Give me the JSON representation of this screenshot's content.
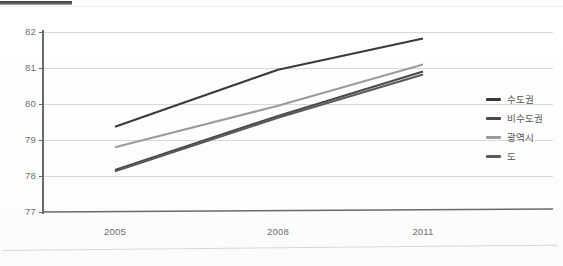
{
  "page": {
    "background_color": "#ffffff",
    "top_rule_color": "#3d3d3d",
    "bottom_rule_color": "#d8d8d8"
  },
  "axis": {
    "y_ticks": [
      "82",
      "81",
      "80",
      "79",
      "78",
      "77"
    ],
    "x_ticks": [
      "2005",
      "2008",
      "2011"
    ],
    "axis_line_color": "#6a6a6a",
    "gridline_color": "#d9d9d9"
  },
  "legend": {
    "position": "right",
    "items": [
      {
        "label": "수도권",
        "color": "#3a3a3a"
      },
      {
        "label": "비수도권",
        "color": "#4a4a4a"
      },
      {
        "label": "광역시",
        "color": "#9b9b9b"
      },
      {
        "label": "도",
        "color": "#5a5a5a"
      }
    ]
  },
  "chart_data": {
    "type": "line",
    "title": "",
    "xlabel": "",
    "ylabel": "",
    "x": [
      "2005",
      "2008",
      "2011"
    ],
    "categories": [
      "2005",
      "2008",
      "2011"
    ],
    "ylim": [
      77,
      82
    ],
    "y_ticks": [
      77,
      78,
      79,
      80,
      81,
      82
    ],
    "grid": true,
    "legend_position": "right",
    "series": [
      {
        "name": "수도권",
        "color": "#3a3a3a",
        "values": [
          79.37,
          80.95,
          81.82
        ]
      },
      {
        "name": "비수도권",
        "color": "#4a4a4a",
        "values": [
          78.17,
          79.67,
          80.9
        ]
      },
      {
        "name": "광역시",
        "color": "#9b9b9b",
        "values": [
          78.8,
          79.95,
          81.1
        ]
      },
      {
        "name": "도",
        "color": "#5a5a5a",
        "values": [
          78.13,
          79.62,
          80.82
        ]
      }
    ]
  }
}
